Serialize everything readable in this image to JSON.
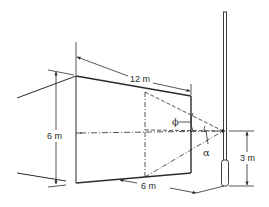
{
  "figure": {
    "type": "technical-diagram",
    "colors": {
      "ink": "#2a2a2a",
      "background": "#ffffff"
    }
  },
  "dimensions": {
    "length_top": "12 m",
    "height_left": "6 m",
    "width_bottom": "6 m",
    "pole_height": "3 m"
  },
  "angles": {
    "vertical_angle": "ϕ",
    "horizontal_angle": "α"
  }
}
